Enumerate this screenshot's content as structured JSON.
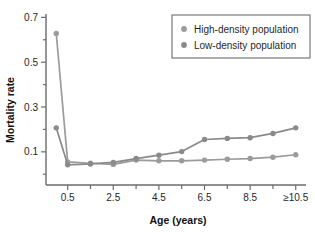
{
  "chart_data": {
    "type": "line",
    "title": "",
    "xlabel": "Age (years)",
    "ylabel": "Mortality rate",
    "grid": false,
    "legend_position": "top-right",
    "x": [
      0,
      0.5,
      1.5,
      2.5,
      3.5,
      4.5,
      5.5,
      6.5,
      7.5,
      8.5,
      9.5,
      10.5
    ],
    "xtick_values": [
      0.5,
      2.5,
      4.5,
      6.5,
      8.5,
      10.5
    ],
    "xtick_labels": [
      "0.5",
      "2.5",
      "4.5",
      "6.5",
      "8.5",
      "≥10.5"
    ],
    "xminor_values": [
      1.5,
      3.5,
      5.5,
      7.5,
      9.5
    ],
    "xlim": [
      -0.45,
      10.95
    ],
    "ylim": [
      -0.048,
      0.715
    ],
    "ytick_values": [
      0.1,
      0.3,
      0.5,
      0.7
    ],
    "ytick_labels": [
      "0.1",
      "0.3",
      "0.5",
      "0.7"
    ],
    "yminor_values": [
      0.0,
      0.2,
      0.4,
      0.6
    ],
    "series": [
      {
        "name": "High-density population",
        "color": "#9b9b9b",
        "values": [
          0.628,
          0.055,
          0.049,
          0.044,
          0.063,
          0.06,
          0.06,
          0.063,
          0.067,
          0.07,
          0.076,
          0.087
        ]
      },
      {
        "name": "Low-density population",
        "color": "#8a8a8a",
        "values": [
          0.207,
          0.042,
          0.046,
          0.053,
          0.07,
          0.085,
          0.101,
          0.155,
          0.16,
          0.163,
          0.182,
          0.207
        ]
      }
    ]
  },
  "legend": {
    "entries": [
      {
        "label": "High-density population",
        "marker": "circle-marker"
      },
      {
        "label": "Low-density population",
        "marker": "circle-marker"
      }
    ]
  },
  "axes": {
    "x_title": "Age (years)",
    "y_title": "Mortality rate"
  }
}
